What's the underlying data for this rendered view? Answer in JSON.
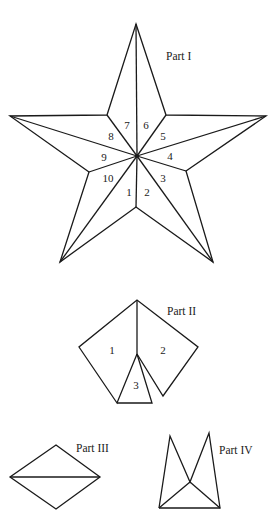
{
  "parts": {
    "part1": {
      "label": "Part I",
      "segments": [
        "1",
        "2",
        "3",
        "4",
        "5",
        "6",
        "7",
        "8",
        "9",
        "10"
      ]
    },
    "part2": {
      "label": "Part II",
      "segments": [
        "1",
        "2",
        "3"
      ]
    },
    "part3": {
      "label": "Part III"
    },
    "part4": {
      "label": "Part IV"
    }
  },
  "colors": {
    "line": "#1a1a1a",
    "background": "#ffffff"
  }
}
